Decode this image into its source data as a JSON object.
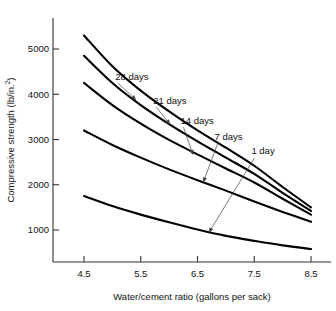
{
  "chart_data": {
    "type": "line",
    "title": "",
    "xlabel": "Water/cement ratio (gallons per sack)",
    "ylabel": "Compressive strength (lb/in.²)",
    "ylabel_main": "Compressive strength (lb/in.",
    "ylabel_sup": "2",
    "ylabel_tail": ")",
    "xlim": [
      4.2,
      8.7
    ],
    "ylim": [
      0,
      5600
    ],
    "grid": false,
    "legend_position": "inline-annotations",
    "xticks": [
      "4.5",
      "5.5",
      "6.5",
      "7.5",
      "8.5"
    ],
    "xtick_values": [
      4.5,
      5.5,
      6.5,
      7.5,
      8.5
    ],
    "yticks": [
      "1000",
      "2000",
      "3000",
      "4000",
      "5000"
    ],
    "ytick_values": [
      1000,
      2000,
      3000,
      4000,
      5000
    ],
    "x": [
      4.5,
      5.0,
      5.5,
      6.0,
      6.5,
      7.0,
      7.5,
      8.0,
      8.5
    ],
    "series": [
      {
        "name": "28 days",
        "label": "28 days",
        "values": [
          5300,
          4620,
          4080,
          3620,
          3200,
          2820,
          2420,
          1950,
          1500
        ],
        "color": "#000000"
      },
      {
        "name": "21 days",
        "label": "21 days",
        "values": [
          4850,
          4250,
          3760,
          3340,
          2960,
          2600,
          2240,
          1820,
          1420
        ],
        "color": "#000000"
      },
      {
        "name": "14 days",
        "label": "14 days",
        "values": [
          4250,
          3760,
          3350,
          2990,
          2670,
          2360,
          2050,
          1690,
          1340
        ],
        "color": "#000000"
      },
      {
        "name": "7 days",
        "label": "7 days",
        "values": [
          3200,
          2880,
          2600,
          2340,
          2100,
          1870,
          1630,
          1400,
          1180
        ],
        "color": "#000000"
      },
      {
        "name": "1 day",
        "label": "1 day",
        "values": [
          1750,
          1530,
          1340,
          1170,
          1010,
          870,
          760,
          660,
          580
        ],
        "color": "#000000"
      }
    ],
    "annotations": [
      {
        "label": "28 days",
        "text_x": 5.05,
        "text_y": 4320,
        "point_x": 5.42,
        "point_y": 3870
      },
      {
        "label": "21 days",
        "text_x": 5.72,
        "text_y": 3790,
        "point_x": 6.02,
        "point_y": 3330
      },
      {
        "label": "14 days",
        "text_x": 6.2,
        "text_y": 3350,
        "point_x": 6.42,
        "point_y": 2660
      },
      {
        "label": "7 days",
        "text_x": 6.8,
        "text_y": 2980,
        "point_x": 6.6,
        "point_y": 2050
      },
      {
        "label": "1 day",
        "text_x": 7.45,
        "text_y": 2670,
        "point_x": 6.7,
        "point_y": 940
      }
    ]
  },
  "axes": {
    "x_axis_title": "Water/cement ratio (gallons per sack)",
    "y_axis_title": "Compressive strength (lb/in.2)"
  }
}
